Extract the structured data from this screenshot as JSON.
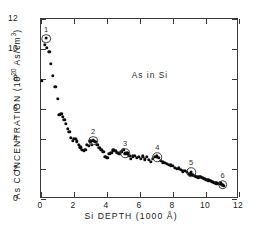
{
  "chart_data": {
    "type": "scatter",
    "title": "",
    "annotation": "As in Si",
    "xlabel_parts": {
      "pre": "Si DEPTH (1000 ",
      "unit": "Å",
      "post": ")"
    },
    "xlabel": "Si DEPTH (1000 Å)",
    "ylabel_parts": {
      "pre": "As CONCENTRATION (10",
      "sup": "20",
      "post": " As/cm",
      "sup2": "3",
      "close": ")"
    },
    "ylabel": "As CONCENTRATION (10^20 As/cm^3)",
    "xlim": [
      0,
      12
    ],
    "ylim": [
      0,
      12
    ],
    "xticks": [
      0,
      2,
      4,
      6,
      8,
      10,
      12
    ],
    "xtick_labels": [
      "0",
      "2",
      "4",
      "6",
      "8",
      "10",
      "12"
    ],
    "yticks": [
      0,
      2,
      4,
      6,
      8,
      10,
      12
    ],
    "ytick_labels": [
      "0",
      "2",
      "4",
      "6",
      "8",
      "10",
      "12"
    ],
    "grid": false,
    "legend": null,
    "x": [
      0.05,
      0.22,
      0.36,
      0.5,
      0.58,
      0.72,
      0.86,
      1.0,
      1.12,
      1.22,
      1.32,
      1.42,
      1.52,
      1.62,
      1.72,
      1.82,
      1.92,
      2.0,
      2.1,
      2.18,
      2.28,
      2.38,
      2.48,
      2.58,
      2.68,
      2.78,
      2.88,
      2.98,
      3.08,
      3.18,
      3.3,
      3.42,
      3.54,
      3.66,
      3.78,
      3.9,
      4.02,
      4.14,
      4.26,
      4.38,
      4.5,
      4.62,
      4.74,
      4.86,
      4.98,
      5.1,
      5.22,
      5.34,
      5.46,
      5.58,
      5.7,
      5.82,
      5.94,
      6.06,
      6.18,
      6.3,
      6.42,
      6.54,
      6.66,
      6.78,
      6.9,
      7.02,
      7.14,
      7.26,
      7.38,
      7.5,
      7.62,
      7.74,
      7.86,
      7.98,
      8.1,
      8.22,
      8.34,
      8.46,
      8.58,
      8.7,
      8.82,
      8.94,
      9.06,
      9.18,
      9.3,
      9.42,
      9.54,
      9.66,
      9.78,
      9.9,
      10.02,
      10.14,
      10.26,
      10.38,
      10.5,
      10.62,
      10.74,
      10.86,
      10.98,
      11.08
    ],
    "y": [
      7.9,
      10.3,
      10.1,
      9.8,
      9.0,
      8.2,
      7.5,
      6.7,
      5.6,
      5.7,
      5.5,
      5.3,
      5.0,
      4.7,
      4.5,
      4.1,
      3.9,
      4.0,
      4.0,
      3.85,
      3.6,
      3.45,
      3.3,
      3.2,
      3.3,
      3.6,
      3.55,
      3.85,
      3.6,
      3.9,
      3.8,
      3.6,
      3.4,
      3.3,
      3.15,
      2.8,
      2.75,
      3.0,
      3.1,
      3.25,
      3.2,
      3.1,
      3.0,
      3.15,
      3.3,
      3.0,
      3.05,
      2.9,
      2.7,
      2.85,
      2.9,
      2.75,
      2.8,
      2.7,
      2.85,
      2.65,
      2.8,
      2.6,
      2.5,
      2.7,
      2.8,
      2.9,
      2.75,
      2.55,
      2.45,
      2.4,
      2.35,
      2.3,
      2.25,
      2.2,
      2.1,
      2.0,
      2.05,
      1.95,
      1.85,
      1.9,
      1.8,
      1.7,
      1.65,
      1.6,
      1.55,
      1.5,
      1.45,
      1.5,
      1.4,
      1.35,
      1.3,
      1.25,
      1.2,
      1.15,
      1.1,
      1.05,
      1.0,
      1.05,
      0.95,
      0.9
    ],
    "markers": [
      {
        "label": "1",
        "x": 0.3,
        "y": 10.7
      },
      {
        "label": "2",
        "x": 3.15,
        "y": 3.9
      },
      {
        "label": "3",
        "x": 5.1,
        "y": 3.05
      },
      {
        "label": "4",
        "x": 7.05,
        "y": 2.8
      },
      {
        "label": "5",
        "x": 9.1,
        "y": 1.8
      },
      {
        "label": "6",
        "x": 11.0,
        "y": 0.95
      }
    ]
  }
}
